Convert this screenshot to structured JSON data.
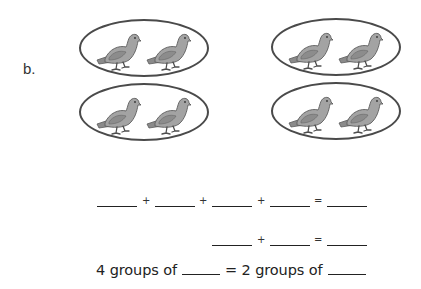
{
  "problem": {
    "label": "b.",
    "groups": [
      {
        "id": "top-left",
        "items": 2,
        "item": "pigeon"
      },
      {
        "id": "bottom-left",
        "items": 2,
        "item": "pigeon"
      },
      {
        "id": "top-right",
        "items": 2,
        "item": "pigeon"
      },
      {
        "id": "bottom-right",
        "items": 2,
        "item": "pigeon"
      }
    ],
    "colors": {
      "ellipse_stroke": "#4a4a4a",
      "bird_fill": "#9a9a9a",
      "bird_shade": "#6e6e6e"
    }
  },
  "equations": {
    "line1": {
      "operators": [
        "+",
        "+",
        "+",
        "="
      ],
      "blanks": 5
    },
    "line2": {
      "operators": [
        "+",
        "="
      ],
      "blanks": 3
    },
    "sentence": {
      "part1": "4 groups of",
      "part2": "= 2 groups of"
    }
  }
}
